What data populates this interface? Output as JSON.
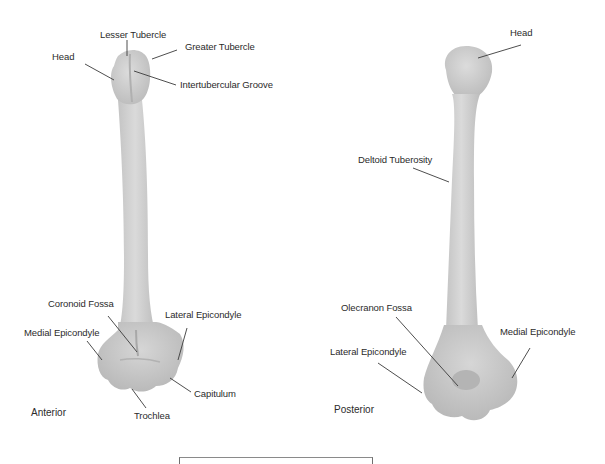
{
  "figure": {
    "colors": {
      "bone_fill": "#d2d2d2",
      "bone_shade": "#b8b8b8",
      "leader_line": "#3a3a3a",
      "text": "#2b2b2b",
      "background": "#ffffff"
    }
  },
  "anterior": {
    "view_label": "Anterior",
    "labels": {
      "head": "Head",
      "lesser_tubercle": "Lesser Tubercle",
      "greater_tubercle": "Greater Tubercle",
      "intertubercular_groove": "Intertubercular Groove",
      "coronoid_fossa": "Coronoid Fossa",
      "lateral_epicondyle": "Lateral Epicondyle",
      "medial_epicondyle": "Medial Epicondyle",
      "capitulum": "Capitulum",
      "trochlea": "Trochlea"
    }
  },
  "posterior": {
    "view_label": "Posterior",
    "labels": {
      "head": "Head",
      "deltoid_tuberosity": "Deltoid Tuberosity",
      "olecranon_fossa": "Olecranon Fossa",
      "lateral_epicondyle": "Lateral Epicondyle",
      "medial_epicondyle": "Medial Epicondyle"
    }
  }
}
